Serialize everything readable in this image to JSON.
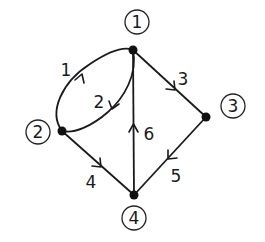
{
  "diagram": {
    "type": "directed-graph",
    "nodes": [
      {
        "id": "1",
        "label": "1",
        "x": 133,
        "y": 50,
        "label_x": 137,
        "label_y": 22
      },
      {
        "id": "2",
        "label": "2",
        "x": 62,
        "y": 131,
        "label_x": 38,
        "label_y": 132
      },
      {
        "id": "3",
        "label": "3",
        "x": 206,
        "y": 117,
        "label_x": 233,
        "label_y": 106
      },
      {
        "id": "4",
        "label": "4",
        "x": 134,
        "y": 195,
        "label_x": 134,
        "label_y": 218
      }
    ],
    "edges": [
      {
        "id": "1",
        "label": "1",
        "from": "2",
        "to": "1",
        "shape": "curve-outer",
        "label_x": 66,
        "label_y": 70
      },
      {
        "id": "2",
        "label": "2",
        "from": "1",
        "to": "2",
        "shape": "curve-inner",
        "label_x": 99,
        "label_y": 102
      },
      {
        "id": "3",
        "label": "3",
        "from": "1",
        "to": "3",
        "shape": "straight",
        "label_x": 183,
        "label_y": 79
      },
      {
        "id": "4",
        "label": "4",
        "from": "2",
        "to": "4",
        "shape": "straight",
        "label_x": 91,
        "label_y": 182
      },
      {
        "id": "5",
        "label": "5",
        "from": "3",
        "to": "4",
        "shape": "straight",
        "label_x": 176,
        "label_y": 176
      },
      {
        "id": "6",
        "label": "6",
        "from": "4",
        "to": "1",
        "shape": "straight",
        "label_x": 149,
        "label_y": 134
      }
    ]
  }
}
